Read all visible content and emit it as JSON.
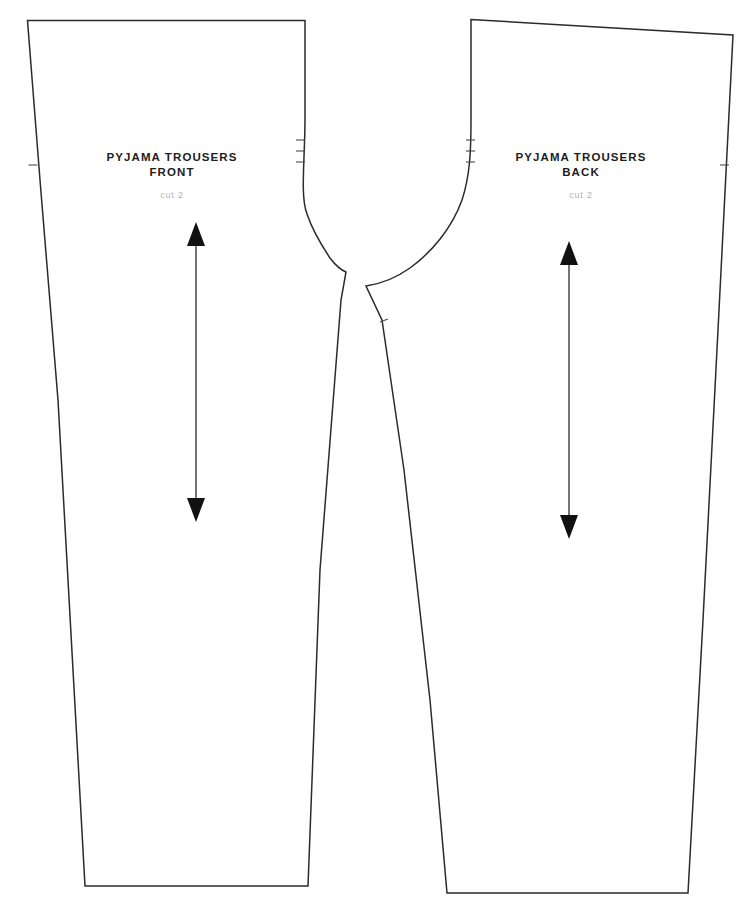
{
  "document": {
    "kind": "sewing-pattern-sheet",
    "background_color": "#ffffff",
    "line_color": "#2b2b2b",
    "label_color": "#1d1d1d",
    "sub_label_color": "#b3b3b3",
    "width": 752,
    "height": 922
  },
  "pieces": [
    {
      "id": "front",
      "name": "PYJAMA TROUSERS",
      "view": "FRONT",
      "cut": "cut 2",
      "label_x": 172,
      "title_y": 161,
      "view_y": 176,
      "cut_y": 198,
      "outline": "M 27.5 20.5 L 305 20.5 L 305 118 C 305 160 300 196 307 214 C 313 232 322 246 330 258 C 336 266 341 270 346 272 L 341 300 L 320 570 L 308 886 L 85 886 L 58 400 L 40 180 Z",
      "grainline": {
        "x": 196,
        "y_top": 226,
        "y_bottom": 518,
        "head_half_width": 9,
        "head_length": 22
      },
      "notches": [
        {
          "x": 28.5,
          "y": 165,
          "dx": 9,
          "dy": 0
        },
        {
          "x": 296,
          "y": 140,
          "dx": -9,
          "dy": 0
        },
        {
          "x": 296,
          "y": 151,
          "dx": -9,
          "dy": 0
        },
        {
          "x": 296,
          "y": 162,
          "dx": -9,
          "dy": 0
        }
      ]
    },
    {
      "id": "back",
      "name": "PYJAMA TROUSERS",
      "view": "BACK",
      "cut": "cut 2",
      "label_x": 581,
      "title_y": 161,
      "view_y": 176,
      "cut_y": 198,
      "outline": "M 471 19.5 L 733 35 L 718 330 L 703 620 L 688 893 L 447 893 L 430 700 L 404 470 L 382 320 L 366 286 C 380 284 396 278 410 268 C 432 252 452 228 462 200 C 470 176 471 150 471 120 Z",
      "grainline": {
        "x": 569,
        "y_top": 245,
        "y_bottom": 535,
        "head_half_width": 9,
        "head_length": 22
      },
      "notches": [
        {
          "x": 729,
          "y": 165,
          "dx": -9,
          "dy": 0
        },
        {
          "x": 466,
          "y": 140,
          "dx": 9,
          "dy": 0
        },
        {
          "x": 466,
          "y": 151,
          "dx": 9,
          "dy": 0
        },
        {
          "x": 466,
          "y": 162,
          "dx": 9,
          "dy": 0
        },
        {
          "x": 380,
          "y": 322,
          "dx": 8,
          "dy": -3
        }
      ]
    }
  ]
}
